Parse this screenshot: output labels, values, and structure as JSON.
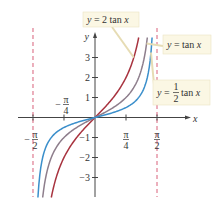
{
  "chart_data": {
    "type": "line",
    "title": "",
    "xlabel": "x",
    "ylabel": "y",
    "xlim": [
      -1.5708,
      1.5708
    ],
    "ylim": [
      -4,
      4
    ],
    "x_ticks": [
      {
        "value": -1.5708,
        "label_num": "π",
        "label_den": "2",
        "sign": "−",
        "position": "below"
      },
      {
        "value": -0.7854,
        "label_num": "π",
        "label_den": "4",
        "sign": "−",
        "position": "above"
      },
      {
        "value": 0.7854,
        "label_num": "π",
        "label_den": "4",
        "sign": "",
        "position": "below"
      },
      {
        "value": 1.5708,
        "label_num": "π",
        "label_den": "2",
        "sign": "",
        "position": "below"
      }
    ],
    "y_ticks": [
      {
        "value": 3,
        "label": "3"
      },
      {
        "value": 2,
        "label": "2"
      },
      {
        "value": 1,
        "label": "1"
      },
      {
        "value": -1,
        "label": "−1"
      },
      {
        "value": -2,
        "label": "−2"
      },
      {
        "value": -3,
        "label": "−3"
      }
    ],
    "asymptotes": [
      -1.5708,
      1.5708
    ],
    "series": [
      {
        "name": "y = 2 tan x",
        "factor": 2,
        "color": "#a8333f"
      },
      {
        "name": "y = tan x",
        "factor": 1,
        "color": "#8e7e8c"
      },
      {
        "name": "y = 1/2 tan x",
        "factor": 0.5,
        "color": "#3b8fcb"
      }
    ],
    "annotations": [
      {
        "text_pre": "y",
        "text_post": " = 2 tan ",
        "var": "x",
        "target_series": "y = 2 tan x"
      },
      {
        "text_pre": "y",
        "text_post": " = tan ",
        "var": "x",
        "target_series": "y = tan x"
      },
      {
        "text_pre": "y",
        "text_post": " = ",
        "frac_num": "1",
        "frac_den": "2",
        "text_tail": "tan ",
        "var": "x",
        "target_series": "y = 1/2 tan x"
      }
    ],
    "grid": false,
    "legend": "callout boxes"
  },
  "colors": {
    "axis": "#444444",
    "asymptote": "#d9607a",
    "label_bg": "#fbf7e4",
    "label_border": "#ebe4c4",
    "leader": "#e6dcb4"
  }
}
